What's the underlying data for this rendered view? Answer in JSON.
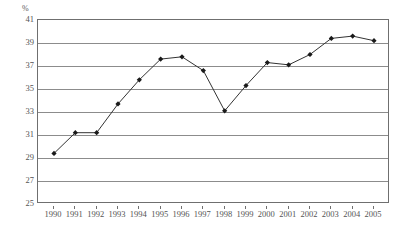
{
  "chart_data": {
    "type": "line",
    "title": "",
    "subtitle": "",
    "xlabel": "",
    "ylabel": "",
    "unit_label": "%",
    "categories": [
      "1990",
      "1991",
      "1992",
      "1993",
      "1994",
      "1995",
      "1996",
      "1997",
      "1998",
      "1999",
      "2000",
      "2001",
      "2002",
      "2003",
      "2004",
      "2005"
    ],
    "values": [
      29.4,
      31.2,
      31.2,
      33.7,
      35.8,
      37.6,
      37.8,
      36.6,
      33.1,
      35.3,
      37.3,
      37.1,
      38.0,
      39.4,
      39.6,
      39.2
    ],
    "series": [
      {
        "name": "",
        "values": [
          29.4,
          31.2,
          31.2,
          33.7,
          35.8,
          37.6,
          37.8,
          36.6,
          33.1,
          35.3,
          37.3,
          37.1,
          38.0,
          39.4,
          39.6,
          39.2
        ]
      }
    ],
    "ylim": [
      25,
      41
    ],
    "ytick_labels": [
      "41",
      "39",
      "37",
      "35",
      "33",
      "31",
      "29",
      "27",
      "25"
    ],
    "ytick_values": [
      41,
      39,
      37,
      35,
      33,
      31,
      29,
      27,
      25
    ],
    "xtick_labels": [
      "1990",
      "1991",
      "1992",
      "1993",
      "1994",
      "1995",
      "1996",
      "1997",
      "1998",
      "1999",
      "2000",
      "2001",
      "2002",
      "2003",
      "2004",
      "2005"
    ],
    "grid": true,
    "legend": false,
    "legend_position": "none",
    "marker": "diamond",
    "line_color": "#333333",
    "marker_color": "#1a1a1a",
    "grid_color": "#8c8c8c",
    "border_color": "#6f6f6f",
    "background_color": "#ffffff"
  }
}
